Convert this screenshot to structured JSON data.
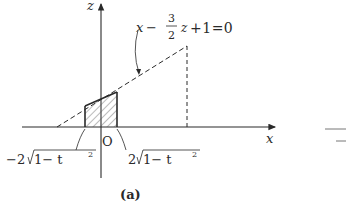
{
  "figure": {
    "caption": "(a)",
    "axes": {
      "x_label": "x",
      "z_label": "z",
      "origin_label": "O"
    },
    "line_equation": {
      "lhs_var": "x",
      "minus": "−",
      "frac_num": "3",
      "frac_den": "2",
      "z_var": "z",
      "rest": "+1=0"
    },
    "bound_labels": {
      "left": {
        "prefix": "−2",
        "radicand": "1− t",
        "exp": "2"
      },
      "right": {
        "prefix": "2",
        "radicand": "1− t",
        "exp": "2"
      }
    },
    "colors": {
      "ink": "#2a2a2a",
      "hatch": "#555555"
    }
  }
}
